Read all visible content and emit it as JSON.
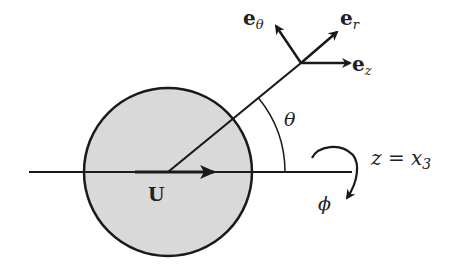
{
  "figure": {
    "type": "spherical-coordinates-schematic"
  },
  "labels": {
    "velocity": "U",
    "e_theta_base": "e",
    "e_theta_sub": "θ",
    "e_r_base": "e",
    "e_r_sub": "r",
    "e_z_base": "e",
    "e_z_sub": "z",
    "theta": "θ",
    "axis": "z = x",
    "axis_sub": "3",
    "phi": "ϕ"
  },
  "colors": {
    "sphere_fill": "#d9d9d9",
    "stroke": "#1a1a1a",
    "background": "#ffffff"
  }
}
